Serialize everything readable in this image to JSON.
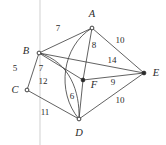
{
  "figure": {
    "width": 166,
    "height": 145,
    "background": "#ffffff",
    "ink_color": "#3a3a3a",
    "text_color": "#2b2b2b"
  },
  "vertices": [
    {
      "id": "A",
      "label": "A",
      "x": 92,
      "y": 28,
      "label_x": 92,
      "label_y": 14,
      "marker": "open"
    },
    {
      "id": "B",
      "label": "B",
      "x": 39,
      "y": 53,
      "label_x": 26,
      "label_y": 51,
      "marker": "open"
    },
    {
      "id": "C",
      "label": "C",
      "x": 27,
      "y": 90,
      "label_x": 15,
      "label_y": 90,
      "marker": "open"
    },
    {
      "id": "D",
      "label": "D",
      "x": 79,
      "y": 119,
      "label_x": 79,
      "label_y": 133,
      "marker": "open"
    },
    {
      "id": "E",
      "label": "E",
      "x": 144,
      "y": 73,
      "label_x": 156,
      "label_y": 73,
      "marker": "solid"
    },
    {
      "id": "F",
      "label": "F",
      "x": 83,
      "y": 80,
      "label_x": 94,
      "label_y": 85,
      "marker": "solid"
    }
  ],
  "edges": [
    {
      "id": "B-A",
      "from": "B",
      "to": "A",
      "weight": "7",
      "shape": "straight",
      "label_x": 58,
      "label_y": 28
    },
    {
      "id": "A-E",
      "from": "A",
      "to": "E",
      "weight": "10",
      "shape": "straight",
      "label_x": 120,
      "label_y": 40
    },
    {
      "id": "A-F",
      "from": "A",
      "to": "F",
      "weight": "8",
      "shape": "straight",
      "label_x": 94,
      "label_y": 45
    },
    {
      "id": "B-E",
      "from": "B",
      "to": "E",
      "weight": "14",
      "shape": "straight",
      "label_x": 112,
      "label_y": 60
    },
    {
      "id": "B-C",
      "from": "B",
      "to": "C",
      "weight": "5",
      "shape": "straight",
      "label_x": 15,
      "label_y": 68
    },
    {
      "id": "B-F",
      "from": "B",
      "to": "F",
      "weight": "7",
      "shape": "straight",
      "label_x": 41,
      "label_y": 68
    },
    {
      "id": "A-D",
      "from": "A",
      "to": "D",
      "weight": "12",
      "shape": "curve-left",
      "label_x": 43,
      "label_y": 81
    },
    {
      "id": "F-D",
      "from": "F",
      "to": "D",
      "weight": "6",
      "shape": "straight",
      "label_x": 72,
      "label_y": 96
    },
    {
      "id": "F-E",
      "from": "F",
      "to": "E",
      "weight": "9",
      "shape": "straight",
      "label_x": 113,
      "label_y": 82
    },
    {
      "id": "C-D",
      "from": "C",
      "to": "D",
      "weight": "11",
      "shape": "straight",
      "label_x": 45,
      "label_y": 112
    },
    {
      "id": "D-E",
      "from": "D",
      "to": "E",
      "weight": "10",
      "shape": "straight",
      "label_x": 120,
      "label_y": 100
    },
    {
      "id": "B-D",
      "from": "B",
      "to": "D",
      "weight": "",
      "shape": "curve-right",
      "label_x": 0,
      "label_y": 0
    }
  ],
  "artifacts": {
    "scan_streak": {
      "x": 40,
      "y1": 0,
      "y2": 145,
      "color": "#e2e2e2"
    }
  }
}
